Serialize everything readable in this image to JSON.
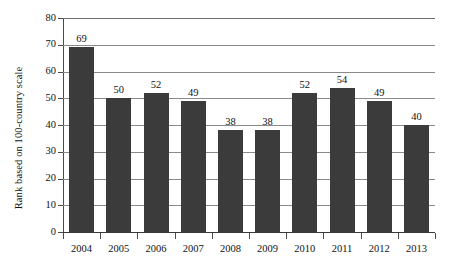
{
  "chart_data": {
    "type": "bar",
    "title": "",
    "subtitle": "",
    "xlabel": "",
    "ylabel": "Rank based on 100-country scale",
    "categories": [
      "2004",
      "2005",
      "2006",
      "2007",
      "2008",
      "2009",
      "2010",
      "2011",
      "2012",
      "2013"
    ],
    "values": [
      69,
      50,
      52,
      49,
      38,
      38,
      52,
      54,
      49,
      40
    ],
    "data_labels": [
      "69",
      "50",
      "52",
      "49",
      "38",
      "38",
      "52",
      "54",
      "49",
      "40"
    ],
    "ylim": [
      0,
      80
    ],
    "y_ticks": [
      0,
      10,
      20,
      30,
      40,
      50,
      60,
      70,
      80
    ],
    "y_tick_labels": [
      "0",
      "10",
      "20",
      "30",
      "40",
      "50",
      "60",
      "70",
      "80"
    ],
    "grid": "horizontal",
    "legend": "none",
    "bar_color": "#3b3b3b",
    "gridline_color": "#8a8a8a",
    "axis_color": "#4a4a4a",
    "background_color": "#ffffff",
    "text_color": "#111111"
  }
}
